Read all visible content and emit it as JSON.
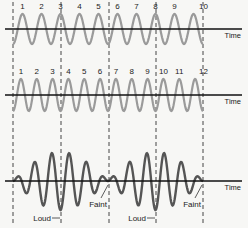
{
  "diagram": {
    "axis_label": "Time",
    "colors": {
      "wave_a": "#9a9a9a",
      "wave_b": "#9a9a9a",
      "sum_wave": "#555555",
      "axis": "#111111",
      "dash": "#444444",
      "background": "#f7f7f5"
    },
    "dashed_lines_x": [
      13,
      61,
      109,
      156,
      203
    ],
    "panels": [
      {
        "name": "wave-a",
        "axis_y": 29,
        "amplitude": 15,
        "cycles": 10,
        "cycle_labels": [
          "1",
          "2",
          "3",
          "4",
          "5",
          "6",
          "7",
          "8",
          "9",
          "10"
        ],
        "time_label": "Time"
      },
      {
        "name": "wave-b",
        "axis_y": 95,
        "amplitude": 16,
        "cycles": 12,
        "cycle_labels": [
          "1",
          "2",
          "3",
          "4",
          "5",
          "6",
          "7",
          "8",
          "9",
          "10",
          "11",
          "12"
        ],
        "time_label": "Time"
      },
      {
        "name": "sum-wave",
        "axis_y": 181,
        "time_label": "Time",
        "annotations": [
          {
            "text": "Loud",
            "x": 61
          },
          {
            "text": "Faint",
            "x": 109
          },
          {
            "text": "Loud",
            "x": 156
          },
          {
            "text": "Faint",
            "x": 203
          }
        ]
      }
    ]
  }
}
